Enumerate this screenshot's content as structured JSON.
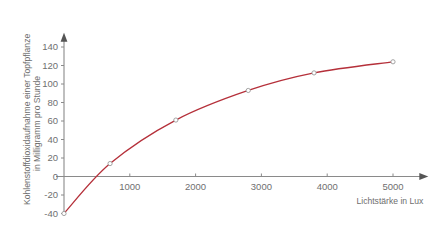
{
  "chart_data": {
    "type": "line",
    "title": "",
    "subtitle": "",
    "xlabel": "Lichtstärke in Lux",
    "ylabel_line1": "Kohlenstoffdioxidaufnahme einer Topfpflanze",
    "ylabel_line2": "in Milligramm pro Stunde",
    "ylabel": "Kohlenstoffdioxidaufnahme einer Topfpflanze in Milligramm pro Stunde",
    "xlim": [
      0,
      5400
    ],
    "ylim": [
      -40,
      150
    ],
    "xticks": [
      1000,
      2000,
      3000,
      4000,
      5000
    ],
    "xtick_labels": [
      "1000",
      "2000",
      "3000",
      "4000",
      "5000"
    ],
    "yticks": [
      -40,
      -20,
      0,
      20,
      40,
      60,
      80,
      100,
      120,
      140
    ],
    "ytick_labels": [
      "-40",
      "-20",
      "0",
      "20",
      "40",
      "60",
      "80",
      "100",
      "120",
      "140"
    ],
    "grid": false,
    "legend": null,
    "series": [
      {
        "name": "CO2-Aufnahme",
        "color": "#b5303a",
        "marker": "open-circle",
        "x": [
          0,
          700,
          1700,
          2800,
          3800,
          5000
        ],
        "values": [
          -40,
          14,
          61,
          93,
          112,
          124
        ]
      }
    ],
    "axis_color": "#8a8a8a",
    "marker_edge_color": "#9a9a9a",
    "marker_fill_color": "#ffffff",
    "background_color": "#ffffff"
  }
}
